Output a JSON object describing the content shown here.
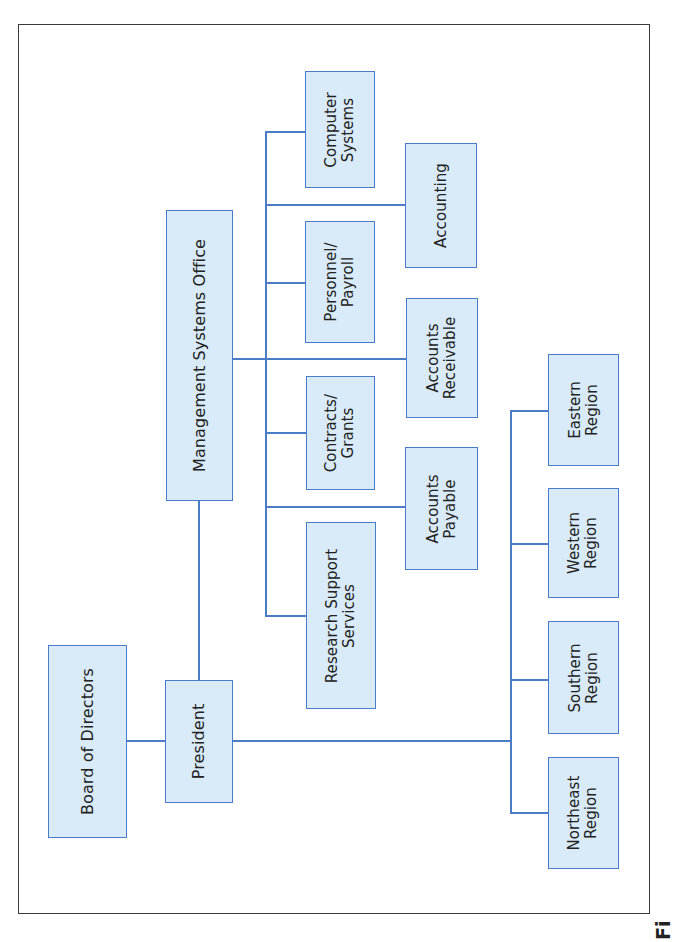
{
  "colors": {
    "box_fill": "#d9eaf8",
    "box_border": "#4a7cc7",
    "line": "#4a7cc7",
    "text": "#222222",
    "frame": "#3a3a3a"
  },
  "chart": {
    "orientation": "rotated-90-ccw",
    "nodes": {
      "board": {
        "label": "Board of Directors"
      },
      "president": {
        "label": "President"
      },
      "mso": {
        "label": "Management Systems Office"
      },
      "computer_systems": {
        "label": "Computer\nSystems"
      },
      "accounting": {
        "label": "Accounting"
      },
      "personnel_payroll": {
        "label": "Personnel/\nPayroll"
      },
      "accounts_receivable": {
        "label": "Accounts\nReceivable"
      },
      "contracts_grants": {
        "label": "Contracts/\nGrants"
      },
      "accounts_payable": {
        "label": "Accounts\nPayable"
      },
      "research_support": {
        "label": "Research Support\nServices"
      },
      "eastern_region": {
        "label": "Eastern\nRegion"
      },
      "western_region": {
        "label": "Western\nRegion"
      },
      "southern_region": {
        "label": "Southern\nRegion"
      },
      "northeast_region": {
        "label": "Northeast\nRegion"
      }
    },
    "edges": [
      [
        "board",
        "president"
      ],
      [
        "president",
        "mso"
      ],
      [
        "mso",
        "computer_systems"
      ],
      [
        "mso",
        "accounting"
      ],
      [
        "mso",
        "personnel_payroll"
      ],
      [
        "mso",
        "accounts_receivable"
      ],
      [
        "mso",
        "contracts_grants"
      ],
      [
        "mso",
        "accounts_payable"
      ],
      [
        "mso",
        "research_support"
      ],
      [
        "president",
        "eastern_region"
      ],
      [
        "president",
        "western_region"
      ],
      [
        "president",
        "southern_region"
      ],
      [
        "president",
        "northeast_region"
      ]
    ]
  },
  "caption": {
    "text": "Fi"
  }
}
